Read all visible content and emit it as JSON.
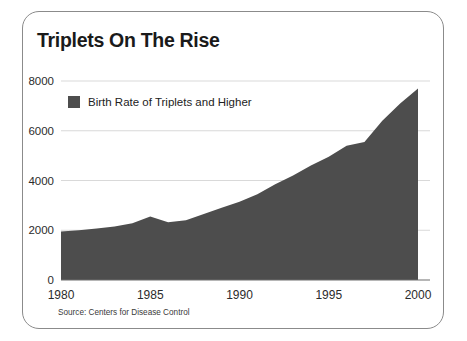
{
  "card": {
    "title": "Triplets On The Rise",
    "source": "Source: Centers for Disease Control"
  },
  "legend": {
    "label": "Birth Rate of Triplets and Higher",
    "swatch_color": "#4d4d4d"
  },
  "chart_data": {
    "type": "area",
    "title": "Triplets On The Rise",
    "xlabel": "",
    "ylabel": "",
    "xlim": [
      1980,
      2000
    ],
    "ylim": [
      0,
      8000
    ],
    "grid": true,
    "legend_position": "top-left-inside",
    "series_color": "#4d4d4d",
    "xticks": [
      "1980",
      "1985",
      "1990",
      "1995",
      "2000"
    ],
    "yticks": [
      "0",
      "2000",
      "4000",
      "6000",
      "8000"
    ],
    "x": [
      1980,
      1981,
      1982,
      1983,
      1984,
      1985,
      1986,
      1987,
      1988,
      1989,
      1990,
      1991,
      1992,
      1993,
      1994,
      1995,
      1996,
      1997,
      1998,
      1999,
      2000
    ],
    "series": [
      {
        "name": "Birth Rate of Triplets and Higher",
        "values": [
          1950,
          2000,
          2070,
          2150,
          2280,
          2550,
          2320,
          2400,
          2650,
          2900,
          3150,
          3450,
          3850,
          4200,
          4600,
          4950,
          5400,
          5550,
          6400,
          7100,
          7700
        ]
      }
    ],
    "annotations": [
      "Source: Centers for Disease Control"
    ]
  }
}
